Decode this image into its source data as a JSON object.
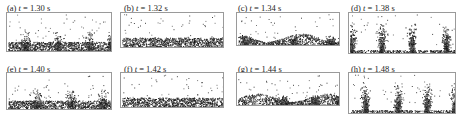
{
  "figure": {
    "panels": [
      {
        "id": "a",
        "tag": "(a)",
        "time": "1.30 s",
        "pattern": "peaks",
        "peaks": [
          0.17,
          0.48,
          0.78,
          0.98
        ],
        "fill": 0.25
      },
      {
        "id": "b",
        "tag": "(b)",
        "time": "1.32 s",
        "pattern": "flat",
        "peaks": [],
        "fill": 0.3
      },
      {
        "id": "c",
        "tag": "(c)",
        "time": "1.34 s",
        "pattern": "wavy",
        "peaks": [
          0.08,
          0.55,
          0.9
        ],
        "fill": 0.35
      },
      {
        "id": "d",
        "tag": "(d)",
        "time": "1.38 s",
        "pattern": "tall",
        "peaks": [
          0.02,
          0.3,
          0.58,
          0.9
        ],
        "fill": 0.15
      },
      {
        "id": "e",
        "tag": "(e)",
        "time": "1.40 s",
        "pattern": "peaks",
        "peaks": [
          0.28,
          0.6,
          0.9
        ],
        "fill": 0.2
      },
      {
        "id": "f",
        "tag": "(f)",
        "time": "1.42 s",
        "pattern": "flat",
        "peaks": [],
        "fill": 0.35
      },
      {
        "id": "g",
        "tag": "(g)",
        "time": "1.44 s",
        "pattern": "wavy",
        "peaks": [
          0.45,
          0.75,
          0.98
        ],
        "fill": 0.4
      },
      {
        "id": "h",
        "tag": "(h)",
        "time": "1.48 s",
        "pattern": "tall",
        "peaks": [
          0.15,
          0.45,
          0.72,
          0.98
        ],
        "fill": 0.15
      }
    ],
    "label_prefix": "t",
    "label_eq": "="
  }
}
